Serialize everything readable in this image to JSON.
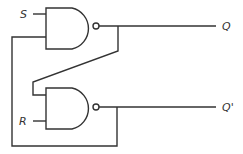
{
  "diagram": {
    "type": "SR latch (NAND)",
    "labels": {
      "s": "S",
      "r": "R",
      "q": "Q",
      "q_bar": "Q'"
    },
    "gates": [
      {
        "name": "top-nand",
        "type": "NAND"
      },
      {
        "name": "bottom-nand",
        "type": "NAND"
      }
    ],
    "stroke_color": "#333333"
  }
}
